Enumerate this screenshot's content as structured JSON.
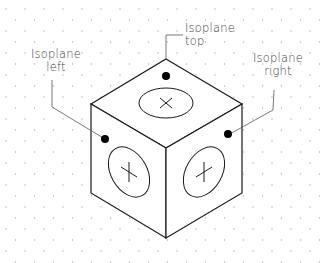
{
  "diagram": {
    "colors": {
      "background": "#ffffff",
      "stroke": "#1a1a1a",
      "leader": "#555555",
      "grid_dot": "#b0b0b0",
      "marker": "#000000",
      "label": "#444444"
    },
    "labels": {
      "top": {
        "line1": "Isoplane",
        "line2": "top"
      },
      "left": {
        "line1": "Isoplane",
        "line2": "left"
      },
      "right": {
        "line1": "Isoplane",
        "line2": "right"
      }
    },
    "faces": [
      {
        "name": "top",
        "symbol": "x-cross"
      },
      {
        "name": "left",
        "symbol": "plus-cross"
      },
      {
        "name": "right",
        "symbol": "plus-cross"
      }
    ],
    "grid": {
      "type": "isometric-dot",
      "dx": 19,
      "dy": 11
    }
  }
}
